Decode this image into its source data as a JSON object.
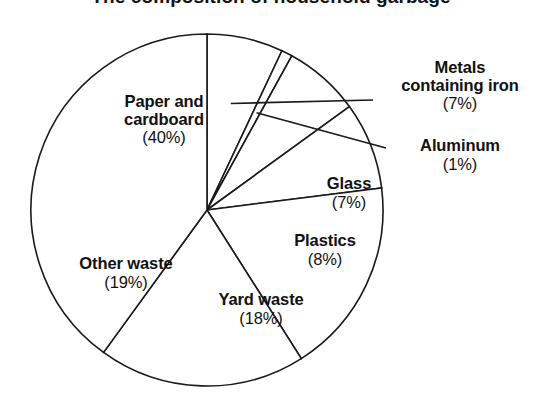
{
  "chart_data": {
    "type": "pie",
    "title": "The composition of household garbage",
    "xlabel": "",
    "ylabel": "",
    "legend_position": "none",
    "grid": false,
    "start_angle_deg": 0,
    "direction": "clockwise",
    "categories": [
      "Metals containing iron",
      "Aluminum",
      "Glass",
      "Plastics",
      "Yard waste",
      "Other waste",
      "Paper and cardboard"
    ],
    "values": [
      7,
      1,
      7,
      8,
      18,
      19,
      40
    ],
    "value_labels": [
      "(7%)",
      "(1%)",
      "(7%)",
      "(8%)",
      "(18%)",
      "(19%)",
      "(40%)"
    ],
    "units": "percent",
    "slices": [
      {
        "name": "Metals containing iron",
        "name_line1": "Metals",
        "name_line2": "containing iron",
        "value": 7,
        "value_label": "(7%)",
        "start_deg": 0,
        "end_deg": 25.2,
        "has_leader_line": true
      },
      {
        "name": "Aluminum",
        "name_line1": "Aluminum",
        "name_line2": "",
        "value": 1,
        "value_label": "(1%)",
        "start_deg": 25.2,
        "end_deg": 28.8,
        "has_leader_line": true
      },
      {
        "name": "Glass",
        "name_line1": "Glass",
        "name_line2": "",
        "value": 7,
        "value_label": "(7%)",
        "start_deg": 28.8,
        "end_deg": 54.0,
        "has_leader_line": false
      },
      {
        "name": "Plastics",
        "name_line1": "Plastics",
        "name_line2": "",
        "value": 8,
        "value_label": "(8%)",
        "start_deg": 54.0,
        "end_deg": 82.8,
        "has_leader_line": false
      },
      {
        "name": "Yard waste",
        "name_line1": "Yard waste",
        "name_line2": "",
        "value": 18,
        "value_label": "(18%)",
        "start_deg": 82.8,
        "end_deg": 147.6,
        "has_leader_line": false
      },
      {
        "name": "Other waste",
        "name_line1": "Other waste",
        "name_line2": "",
        "value": 19,
        "value_label": "(19%)",
        "start_deg": 147.6,
        "end_deg": 216.0,
        "has_leader_line": false
      },
      {
        "name": "Paper and cardboard",
        "name_line1": "Paper and",
        "name_line2": "cardboard",
        "value": 40,
        "value_label": "(40%)",
        "start_deg": 216.0,
        "end_deg": 360.0,
        "has_leader_line": false
      }
    ],
    "colors": {
      "slice_fill": "#ffffff",
      "slice_stroke": "#1a1a1a",
      "text": "#111111",
      "background": "#ffffff"
    },
    "geometry": {
      "center_x": 207,
      "center_y": 210,
      "radius": 176
    }
  }
}
